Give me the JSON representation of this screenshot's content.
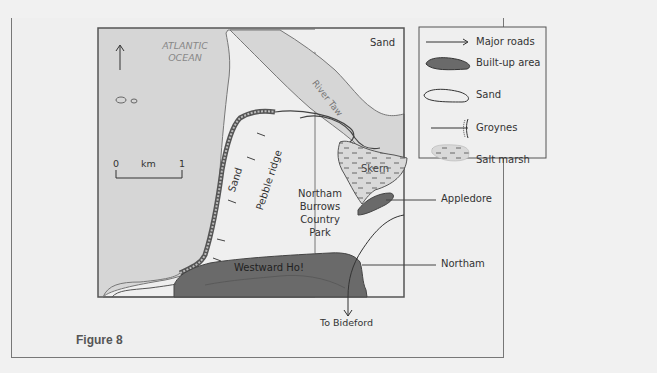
{
  "figure": {
    "caption": "Figure 8"
  },
  "map": {
    "ocean_label_line1": "ATLANTIC",
    "ocean_label_line2": "OCEAN",
    "sand_top_label": "Sand",
    "river_label": "River Taw",
    "sand_beach_label": "Sand",
    "pebble_ridge_label": "Pebble ridge",
    "park_label_line1": "Northam",
    "park_label_line2": "Burrows",
    "park_label_line3": "Country",
    "park_label_line4": "Park",
    "skern_label": "Skern",
    "westward_ho_label": "Westward Ho!",
    "appledore_label": "Appledore",
    "northam_label": "Northam",
    "bideford_label": "To Bideford",
    "north_arrow": "north-arrow",
    "scale": {
      "start": "0",
      "unit": "km",
      "end": "1"
    }
  },
  "legend": {
    "items": [
      {
        "icon": "arrow-icon",
        "label": "Major roads"
      },
      {
        "icon": "built-up-swatch",
        "label": "Built-up area"
      },
      {
        "icon": "sand-swatch",
        "label": "Sand"
      },
      {
        "icon": "groyne-icon",
        "label": "Groynes"
      },
      {
        "icon": "salt-marsh-swatch",
        "label": "Salt marsh"
      }
    ]
  },
  "colors": {
    "sea": "#d6d6d6",
    "sand": "#efefef",
    "built_up": "#6a6a6a",
    "salt_marsh": "#d9d9d9",
    "border": "#555555"
  }
}
